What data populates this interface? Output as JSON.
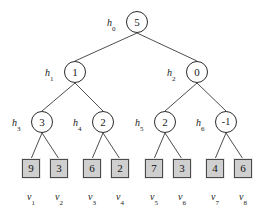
{
  "figure": {
    "type": "binary-tree-diagram",
    "colors": {
      "background": "#ffffff",
      "node_stroke": "#2b2b2b",
      "node_fill": "#ffffff",
      "edge_stroke": "#3a3a3a",
      "leaf_fill": "#cfcfcf",
      "leaf_stroke": "#4a4a4a",
      "text": "#1a1a1a"
    }
  },
  "nodes": [
    {
      "id": "h0",
      "label": "h",
      "sub": "0",
      "value": "5",
      "level": 0,
      "cx": 137,
      "cy": 22,
      "label_x": 107,
      "label_y": 18
    },
    {
      "id": "h1",
      "label": "h",
      "sub": "1",
      "value": "1",
      "level": 1,
      "cx": 75,
      "cy": 72,
      "label_x": 45,
      "label_y": 68
    },
    {
      "id": "h2",
      "label": "h",
      "sub": "2",
      "value": "0",
      "level": 1,
      "cx": 197,
      "cy": 72,
      "label_x": 167,
      "label_y": 68
    },
    {
      "id": "h3",
      "label": "h",
      "sub": "3",
      "value": "3",
      "level": 2,
      "cx": 42,
      "cy": 122,
      "label_x": 12,
      "label_y": 118
    },
    {
      "id": "h4",
      "label": "h",
      "sub": "4",
      "value": "2",
      "level": 2,
      "cx": 103,
      "cy": 122,
      "label_x": 73,
      "label_y": 118
    },
    {
      "id": "h5",
      "label": "h",
      "sub": "5",
      "value": "2",
      "level": 2,
      "cx": 165,
      "cy": 122,
      "label_x": 135,
      "label_y": 118
    },
    {
      "id": "h6",
      "label": "h",
      "sub": "6",
      "value": "-1",
      "level": 2,
      "cx": 226,
      "cy": 122,
      "label_x": 196,
      "label_y": 118
    }
  ],
  "leaves": [
    {
      "id": "v1",
      "label": "v",
      "sub": "1",
      "value": "9",
      "cx": 31,
      "cy": 168,
      "label_x": 31,
      "label_y": 192
    },
    {
      "id": "v2",
      "label": "v",
      "sub": "2",
      "value": "3",
      "cx": 59,
      "cy": 168,
      "label_x": 59,
      "label_y": 192
    },
    {
      "id": "v3",
      "label": "v",
      "sub": "3",
      "value": "6",
      "cx": 92,
      "cy": 168,
      "label_x": 92,
      "label_y": 192
    },
    {
      "id": "v4",
      "label": "v",
      "sub": "4",
      "value": "2",
      "cx": 120,
      "cy": 168,
      "label_x": 120,
      "label_y": 192
    },
    {
      "id": "v5",
      "label": "v",
      "sub": "5",
      "value": "7",
      "cx": 154,
      "cy": 168,
      "label_x": 154,
      "label_y": 192
    },
    {
      "id": "v6",
      "label": "v",
      "sub": "6",
      "value": "3",
      "cx": 182,
      "cy": 168,
      "label_x": 182,
      "label_y": 192
    },
    {
      "id": "v7",
      "label": "v",
      "sub": "7",
      "value": "4",
      "cx": 215,
      "cy": 168,
      "label_x": 215,
      "label_y": 192
    },
    {
      "id": "v8",
      "label": "v",
      "sub": "8",
      "value": "6",
      "cx": 243,
      "cy": 168,
      "label_x": 243,
      "label_y": 192
    }
  ],
  "edges": [
    {
      "from": "h0",
      "to": "h1",
      "x1": 137,
      "y1": 33,
      "x2": 75,
      "y2": 61
    },
    {
      "from": "h0",
      "to": "h2",
      "x1": 137,
      "y1": 33,
      "x2": 197,
      "y2": 61
    },
    {
      "from": "h1",
      "to": "h3",
      "x1": 75,
      "y1": 83,
      "x2": 42,
      "y2": 111
    },
    {
      "from": "h1",
      "to": "h4",
      "x1": 75,
      "y1": 83,
      "x2": 103,
      "y2": 111
    },
    {
      "from": "h2",
      "to": "h5",
      "x1": 197,
      "y1": 83,
      "x2": 165,
      "y2": 111
    },
    {
      "from": "h2",
      "to": "h6",
      "x1": 197,
      "y1": 83,
      "x2": 226,
      "y2": 111
    },
    {
      "from": "h3",
      "to": "v1",
      "x1": 42,
      "y1": 133,
      "x2": 31,
      "y2": 159
    },
    {
      "from": "h3",
      "to": "v2",
      "x1": 42,
      "y1": 133,
      "x2": 59,
      "y2": 159
    },
    {
      "from": "h4",
      "to": "v3",
      "x1": 103,
      "y1": 133,
      "x2": 92,
      "y2": 159
    },
    {
      "from": "h4",
      "to": "v4",
      "x1": 103,
      "y1": 133,
      "x2": 120,
      "y2": 159
    },
    {
      "from": "h5",
      "to": "v5",
      "x1": 165,
      "y1": 133,
      "x2": 154,
      "y2": 159
    },
    {
      "from": "h5",
      "to": "v6",
      "x1": 165,
      "y1": 133,
      "x2": 182,
      "y2": 159
    },
    {
      "from": "h6",
      "to": "v7",
      "x1": 226,
      "y1": 133,
      "x2": 215,
      "y2": 159
    },
    {
      "from": "h6",
      "to": "v8",
      "x1": 226,
      "y1": 133,
      "x2": 243,
      "y2": 159
    }
  ]
}
